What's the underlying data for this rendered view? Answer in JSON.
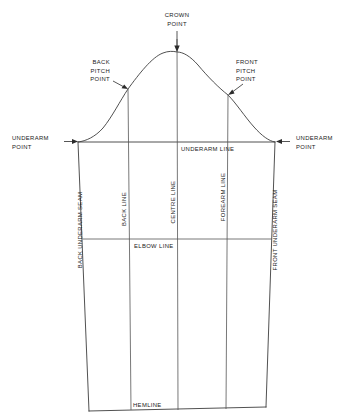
{
  "diagram": {
    "type": "technical-pattern-drawing",
    "background_color": "#ffffff",
    "line_color": "#3d3d3d",
    "text_color": "#1a1a1a",
    "labels": {
      "crown_point": "CROWN\nPOINT",
      "crown_point_line1": "CROWN",
      "crown_point_line2": "POINT",
      "back_pitch_point_line1": "BACK",
      "back_pitch_point_line2": "PITCH",
      "back_pitch_point_line3": "POINT",
      "front_pitch_point_line1": "FRONT",
      "front_pitch_point_line2": "PITCH",
      "front_pitch_point_line3": "POINT",
      "underarm_point_left_line1": "UNDERARM",
      "underarm_point_left_line2": "POINT",
      "underarm_point_right_line1": "UNDERARM",
      "underarm_point_right_line2": "POINT",
      "underarm_line": "UNDERARM LINE",
      "elbow_line": "ELBOW LINE",
      "hemline": "HEMLINE",
      "back_underarm_seam": "BACK UNDERARM SEAM",
      "front_underarm_seam": "FRONT UNDERARM SEAM",
      "back_line": "BACK LINE",
      "centre_line": "CENTRE LINE",
      "forearm_line": "FOREARM LINE"
    },
    "geometry": {
      "crown_point": [
        177,
        52
      ],
      "back_pitch_point": [
        128,
        89
      ],
      "front_pitch_point": [
        228,
        95
      ],
      "underarm_left": [
        78,
        142
      ],
      "underarm_right": [
        275,
        142
      ],
      "hem_left": [
        89,
        411
      ],
      "hem_right": [
        266,
        407
      ],
      "elbow_line_y": 239,
      "back_line_x": 128,
      "centre_line_x": 177,
      "forearm_line_x": 228
    }
  }
}
